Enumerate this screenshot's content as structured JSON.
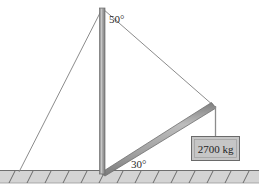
{
  "figure": {
    "background_color": "#ffffff",
    "width": 259,
    "height": 194
  },
  "labels": {
    "cable_angle": "50°",
    "boom_angle": "30°",
    "load_mass": "2700 kg"
  },
  "colors": {
    "member_fill": "#9a9a9a",
    "member_fill_light": "#c8c8c8",
    "member_stroke": "#6e6e6e",
    "cable_stroke": "#8c8c8c",
    "ground_fill": "#d4d4d4",
    "ground_stroke": "#6f6f6f",
    "hatch_stroke": "#5f5f5f",
    "box_fill": "#c6c6c6",
    "box_stroke": "#6a6a6a",
    "text": "#2b2b2b"
  },
  "geometry": {
    "mast": {
      "name": "vertical-mast",
      "top": {
        "x": 102,
        "y": 8
      },
      "base": {
        "x": 102,
        "y": 172
      },
      "width": 5
    },
    "boom": {
      "name": "inclined-boom",
      "base": {
        "x": 102,
        "y": 172
      },
      "tip": {
        "x": 214,
        "y": 106
      },
      "width": 6,
      "angle_deg": 30
    },
    "guy_wire": {
      "name": "guy-wire",
      "from": {
        "x": 102,
        "y": 8
      },
      "to": {
        "x": 19,
        "y": 172
      }
    },
    "top_cable": {
      "name": "top-cable",
      "from": {
        "x": 102,
        "y": 8
      },
      "to": {
        "x": 214,
        "y": 106
      },
      "angle_deg": 50
    },
    "hanging_cable": {
      "name": "hanging-cable",
      "from": {
        "x": 215,
        "y": 106
      },
      "to": {
        "x": 215,
        "y": 136
      }
    },
    "load_box": {
      "name": "load-box",
      "x": 192,
      "y": 136,
      "width": 48,
      "height": 24
    },
    "ground": {
      "name": "ground-band",
      "x": 0,
      "y": 170,
      "width": 259,
      "height": 13,
      "hatch_count": 14
    },
    "label_positions": {
      "cable_angle": {
        "x": 110,
        "y": 22
      },
      "boom_angle": {
        "x": 132,
        "y": 167
      },
      "load_mass": {
        "x": 216,
        "y": 152
      }
    }
  }
}
